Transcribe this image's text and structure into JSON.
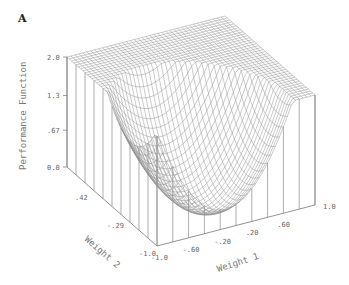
{
  "panel_label": "A",
  "chart_data": {
    "type": "surface3d",
    "title": "",
    "zlabel": "Performance Function",
    "xlabel": "Weight 1",
    "ylabel": "Weight 2",
    "z_ticks": [
      "0.0",
      ".67",
      "1.3",
      "2.0"
    ],
    "x_ticks": [
      "-1.0",
      "-.60",
      "-.20",
      ".20",
      ".60",
      "1.0"
    ],
    "y_ticks": [
      "-1.0",
      "-.29",
      ".42"
    ],
    "xlim": [
      -1.0,
      1.0
    ],
    "ylim": [
      -1.0,
      1.0
    ],
    "zlim": [
      0.0,
      2.0
    ],
    "grid_resolution": 40,
    "colors": {
      "mesh": "#8a8a8a",
      "axes": "#777777",
      "text": "#666666"
    }
  }
}
